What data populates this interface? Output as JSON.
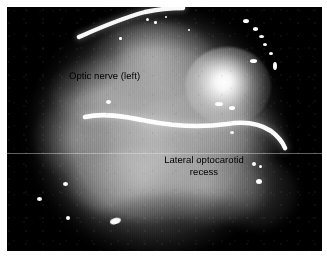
{
  "image": {
    "kind": "endoscopic-surgical-photograph",
    "modality": "grayscale",
    "frame": {
      "page_background": "#ffffff",
      "frame_background": "#000000",
      "frame_left": 7,
      "frame_top": 7,
      "frame_width": 315,
      "frame_height": 244
    },
    "field_of_view": {
      "shape": "circular-vignette",
      "center_x": 0.47,
      "center_y": 0.5,
      "highlight_color": "#ffffff",
      "tissue_midtone": "#a2a2a2",
      "vignette_color": "#000000"
    }
  },
  "annotations": [
    {
      "id": "optic-nerve",
      "text": "Optic nerve (left)",
      "color": "#000000",
      "x": 69,
      "y": 71,
      "align": "left"
    },
    {
      "id": "lateral-optocarotid-recess",
      "text": "Lateral optocarotid\nrecess",
      "color": "#000000",
      "x": 148,
      "y": 155,
      "align": "center"
    }
  ],
  "specular_highlights": {
    "main_hotspot": {
      "x": 178,
      "y": 40,
      "w": 86,
      "h": 78
    },
    "count": 18
  },
  "artifacts": {
    "interlace_striations": true,
    "scanline_y": 146,
    "film_grain": true
  }
}
